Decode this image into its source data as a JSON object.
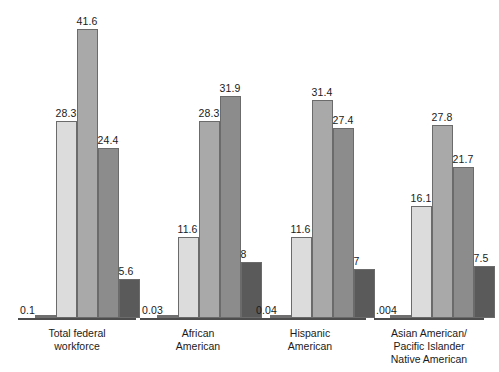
{
  "chart_data": {
    "type": "bar",
    "title": "",
    "subtitle": "",
    "xlabel": "",
    "ylabel": "",
    "grid": false,
    "legend": "none",
    "ylim": [
      0,
      41.6
    ],
    "orientation": "vertical",
    "grouped": true,
    "categories": [
      "Total federal workforce",
      "African American",
      "Hispanic American",
      "Asian American/ Pacific Islander Native American"
    ],
    "category_lines": [
      [
        "Total federal",
        "workforce"
      ],
      [
        "African",
        "American"
      ],
      [
        "Hispanic",
        "American"
      ],
      [
        "Asian American/",
        "Pacific Islander",
        "Native American"
      ]
    ],
    "series": [
      {
        "name": "series-1",
        "color": "#6f6f6f",
        "values": [
          0.1,
          0.03,
          0.04,
          0.004
        ],
        "labels": [
          "0.1",
          "0.03",
          "0.04",
          ".004"
        ]
      },
      {
        "name": "series-2",
        "color": "#dcdcdc",
        "values": [
          28.3,
          11.6,
          11.6,
          16.1
        ],
        "labels": [
          "28.3",
          "11.6",
          "11.6",
          "16.1"
        ]
      },
      {
        "name": "series-3",
        "color": "#a9a9a9",
        "values": [
          41.6,
          28.3,
          31.4,
          27.8
        ],
        "labels": [
          "41.6",
          "28.3",
          "31.4",
          "27.8"
        ]
      },
      {
        "name": "series-4",
        "color": "#8c8c8c",
        "values": [
          24.4,
          31.9,
          27.4,
          21.7
        ],
        "labels": [
          "24.4",
          "31.9",
          "27.4",
          "21.7"
        ]
      },
      {
        "name": "series-5",
        "color": "#5a5a5a",
        "values": [
          5.6,
          8,
          7,
          7.5
        ],
        "labels": [
          "5.6",
          "8",
          "7",
          "7.5"
        ]
      }
    ]
  },
  "layout": {
    "baseline_y": 318,
    "px_per_unit": 6.95,
    "groups": [
      {
        "axis_left": 18,
        "axis_width": 118,
        "bar_left": 35,
        "bar_width": 21,
        "label_center": 77
      },
      {
        "axis_left": 140,
        "axis_width": 116,
        "bar_left": 157,
        "bar_width": 21,
        "label_center": 198
      },
      {
        "axis_left": 254,
        "axis_width": 112,
        "bar_left": 270,
        "bar_width": 21,
        "label_center": 310
      },
      {
        "axis_left": 374,
        "axis_width": 110,
        "bar_left": 390,
        "bar_width": 21,
        "label_center": 429
      }
    ]
  }
}
